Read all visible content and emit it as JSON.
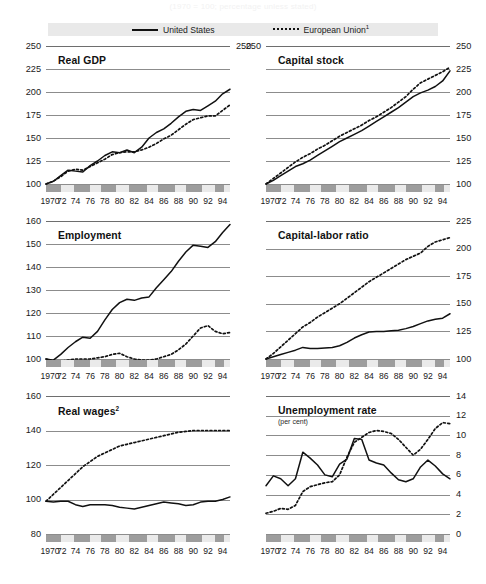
{
  "supertitle": "(1970 = 100; percentage unless stated)",
  "legend": {
    "position": "top",
    "items": [
      {
        "label": "United States",
        "style": "solid",
        "icon": "solid-line-swatch"
      },
      {
        "label": "European Union¹",
        "style": "dotted",
        "icon": "dotted-line-swatch"
      }
    ]
  },
  "x_tick_labels": [
    "1970",
    "72",
    "74",
    "76",
    "78",
    "80",
    "82",
    "84",
    "86",
    "88",
    "90",
    "92",
    "94"
  ],
  "chart_data": [
    {
      "id": "real-gdp",
      "type": "line",
      "title": "Real GDP",
      "subtitle": "",
      "axis_side": "left",
      "xlabel": "",
      "ylabel": "",
      "ylim": [
        100,
        250
      ],
      "yticks": [
        100,
        125,
        150,
        175,
        200,
        225,
        250
      ],
      "grid": true,
      "x": [
        1970,
        1971,
        1972,
        1973,
        1974,
        1975,
        1976,
        1977,
        1978,
        1979,
        1980,
        1981,
        1982,
        1983,
        1984,
        1985,
        1986,
        1987,
        1988,
        1989,
        1990,
        1991,
        1992,
        1993,
        1994,
        1995
      ],
      "series": [
        {
          "name": "United States",
          "style": "solid",
          "values": [
            100,
            103,
            109,
            115,
            114,
            113,
            120,
            125,
            131,
            135,
            134,
            137,
            134,
            140,
            150,
            156,
            160,
            166,
            173,
            179,
            181,
            180,
            185,
            190,
            198,
            203
          ]
        },
        {
          "name": "European Union¹",
          "style": "dotted",
          "values": [
            100,
            103,
            108,
            114,
            116,
            115,
            119,
            123,
            127,
            132,
            134,
            135,
            135,
            137,
            140,
            144,
            149,
            153,
            159,
            165,
            170,
            172,
            174,
            174,
            180,
            186
          ]
        }
      ]
    },
    {
      "id": "capital-stock",
      "type": "line",
      "title": "Capital stock",
      "subtitle": "",
      "axis_side": "right",
      "xlabel": "",
      "ylabel": "",
      "ylim": [
        100,
        250
      ],
      "yticks": [
        100,
        125,
        150,
        175,
        200,
        225,
        250
      ],
      "grid": true,
      "x": [
        1970,
        1971,
        1972,
        1973,
        1974,
        1975,
        1976,
        1977,
        1978,
        1979,
        1980,
        1981,
        1982,
        1983,
        1984,
        1985,
        1986,
        1987,
        1988,
        1989,
        1990,
        1991,
        1992,
        1993,
        1994,
        1995
      ],
      "series": [
        {
          "name": "United States",
          "style": "solid",
          "values": [
            100,
            104,
            109,
            114,
            119,
            122,
            126,
            131,
            136,
            141,
            146,
            150,
            154,
            158,
            163,
            168,
            173,
            178,
            183,
            189,
            195,
            199,
            202,
            206,
            212,
            223
          ]
        },
        {
          "name": "European Union¹",
          "style": "dotted",
          "values": [
            100,
            106,
            112,
            118,
            124,
            129,
            133,
            138,
            142,
            147,
            152,
            156,
            160,
            164,
            169,
            173,
            178,
            183,
            189,
            195,
            203,
            210,
            214,
            218,
            222,
            227
          ]
        }
      ]
    },
    {
      "id": "employment",
      "type": "line",
      "title": "Employment",
      "subtitle": "",
      "axis_side": "left",
      "xlabel": "",
      "ylabel": "",
      "ylim": [
        100,
        160
      ],
      "yticks": [
        100,
        110,
        120,
        130,
        140,
        150,
        160
      ],
      "grid": true,
      "x": [
        1970,
        1971,
        1972,
        1973,
        1974,
        1975,
        1976,
        1977,
        1978,
        1979,
        1980,
        1981,
        1982,
        1983,
        1984,
        1985,
        1986,
        1987,
        1988,
        1989,
        1990,
        1991,
        1992,
        1993,
        1994,
        1995
      ],
      "series": [
        {
          "name": "United States",
          "style": "solid",
          "values": [
            100,
            99.5,
            102,
            105,
            107.5,
            109.5,
            109,
            112,
            117,
            121.5,
            124.5,
            126,
            125.5,
            126.5,
            127,
            131,
            134.5,
            138,
            142.5,
            146.5,
            149.5,
            149,
            148.5,
            151,
            155,
            158.5
          ]
        },
        {
          "name": "European Union¹",
          "style": "dotted",
          "values": [
            100,
            99,
            99,
            99.5,
            100,
            100,
            100,
            100.5,
            101,
            102,
            102.5,
            101,
            100,
            99.5,
            99.5,
            100,
            101,
            102,
            104,
            106.5,
            110,
            113.5,
            114.5,
            112,
            111,
            111.5
          ]
        }
      ]
    },
    {
      "id": "capital-labor-ratio",
      "type": "line",
      "title": "Capital-labor ratio",
      "subtitle": "",
      "axis_side": "right",
      "xlabel": "",
      "ylabel": "",
      "ylim": [
        100,
        225
      ],
      "yticks": [
        100,
        125,
        150,
        175,
        200,
        225
      ],
      "grid": true,
      "x": [
        1970,
        1971,
        1972,
        1973,
        1974,
        1975,
        1976,
        1977,
        1978,
        1979,
        1980,
        1981,
        1982,
        1983,
        1984,
        1985,
        1986,
        1987,
        1988,
        1989,
        1990,
        1991,
        1992,
        1993,
        1994,
        1995
      ],
      "series": [
        {
          "name": "United States",
          "style": "solid",
          "values": [
            100,
            102,
            104,
            106,
            108,
            110.5,
            109.5,
            109.5,
            110,
            110.5,
            112,
            115,
            119,
            122,
            124.5,
            125,
            125,
            125.5,
            126,
            127.5,
            129.5,
            132,
            134.5,
            136,
            137,
            141
          ]
        },
        {
          "name": "European Union¹",
          "style": "dotted",
          "values": [
            100,
            105,
            111,
            117,
            123,
            129,
            133,
            138,
            142,
            146,
            150,
            155,
            160,
            165,
            170,
            174,
            178,
            182,
            186,
            190,
            193,
            196,
            202,
            206,
            208,
            210
          ]
        }
      ]
    },
    {
      "id": "real-wages",
      "type": "line",
      "title": "Real wages²",
      "subtitle": "",
      "axis_side": "left",
      "xlabel": "",
      "ylabel": "",
      "ylim": [
        80,
        160
      ],
      "yticks": [
        80,
        100,
        120,
        140,
        160
      ],
      "grid": true,
      "x": [
        1970,
        1971,
        1972,
        1973,
        1974,
        1975,
        1976,
        1977,
        1978,
        1979,
        1980,
        1981,
        1982,
        1983,
        1984,
        1985,
        1986,
        1987,
        1988,
        1989,
        1990,
        1991,
        1992,
        1993,
        1994,
        1995
      ],
      "series": [
        {
          "name": "United States",
          "style": "solid",
          "values": [
            99,
            98.5,
            99,
            99,
            97,
            96,
            97,
            97,
            97,
            96.5,
            95.5,
            95,
            94.5,
            95.5,
            96.5,
            97.5,
            98.5,
            98,
            97.5,
            96.5,
            97,
            98.5,
            99,
            99,
            100,
            101.5
          ]
        },
        {
          "name": "European Union¹",
          "style": "dotted",
          "values": [
            99,
            103,
            107,
            111,
            115,
            119,
            122,
            125,
            127,
            129,
            131,
            132,
            133,
            134,
            135,
            136,
            137,
            138,
            139,
            139.5,
            140,
            140,
            140,
            140,
            140,
            140
          ]
        }
      ]
    },
    {
      "id": "unemployment-rate",
      "type": "line",
      "title": "Unemployment rate",
      "subtitle": "(per cent)",
      "axis_side": "right",
      "xlabel": "",
      "ylabel": "",
      "ylim": [
        0,
        14
      ],
      "yticks": [
        0,
        2,
        4,
        6,
        8,
        10,
        12,
        14
      ],
      "grid": true,
      "x": [
        1970,
        1971,
        1972,
        1973,
        1974,
        1975,
        1976,
        1977,
        1978,
        1979,
        1980,
        1981,
        1982,
        1983,
        1984,
        1985,
        1986,
        1987,
        1988,
        1989,
        1990,
        1991,
        1992,
        1993,
        1994,
        1995
      ],
      "series": [
        {
          "name": "United States",
          "style": "solid",
          "values": [
            4.9,
            5.9,
            5.6,
            4.9,
            5.6,
            8.3,
            7.7,
            7.0,
            6.0,
            5.8,
            7.1,
            7.6,
            9.7,
            9.6,
            7.5,
            7.2,
            7.0,
            6.2,
            5.5,
            5.3,
            5.6,
            6.8,
            7.5,
            6.9,
            6.1,
            5.6
          ]
        },
        {
          "name": "European Union¹",
          "style": "dotted",
          "values": [
            2.1,
            2.3,
            2.6,
            2.5,
            2.9,
            4.3,
            4.8,
            5.0,
            5.2,
            5.3,
            6.0,
            7.8,
            9.3,
            9.8,
            10.3,
            10.5,
            10.4,
            10.2,
            9.6,
            8.8,
            8.0,
            8.6,
            9.6,
            10.7,
            11.3,
            11.2
          ]
        }
      ]
    }
  ],
  "period_band": {
    "base_color": "#eaeaea",
    "marker_color": "#9d9d9d",
    "segments": [
      {
        "start_pct": 0,
        "width_pct": 8
      },
      {
        "start_pct": 15,
        "width_pct": 9
      },
      {
        "start_pct": 30,
        "width_pct": 8
      },
      {
        "start_pct": 45,
        "width_pct": 10
      },
      {
        "start_pct": 61,
        "width_pct": 9
      },
      {
        "start_pct": 76,
        "width_pct": 9
      },
      {
        "start_pct": 92,
        "width_pct": 5
      }
    ]
  },
  "colors": {
    "line": "#111111",
    "gridline": "#8c8c8c",
    "legend_background": "#e9e9e9",
    "band_base": "#eaeaea",
    "band_marker": "#9d9d9d",
    "text": "#1a1a1a",
    "page_background": "#ffffff"
  }
}
